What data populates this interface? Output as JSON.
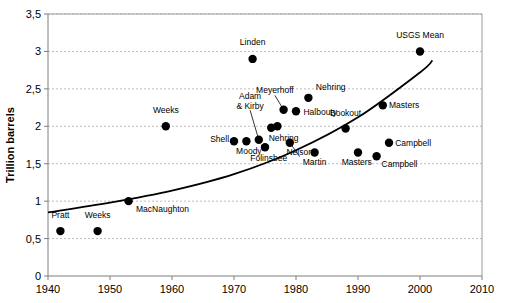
{
  "chart_data": {
    "type": "scatter",
    "title": "",
    "xlabel": "",
    "ylabel": "Trillion barrels",
    "xlim": [
      1940,
      2010
    ],
    "ylim": [
      0,
      3.5
    ],
    "xticks": [
      "1940",
      "1950",
      "1960",
      "1970",
      "1980",
      "1990",
      "2000",
      "2010"
    ],
    "xtick_values": [
      1940,
      1950,
      1960,
      1970,
      1980,
      1990,
      2000,
      2010
    ],
    "yticks": [
      "0",
      "0,5",
      "1",
      "1,5",
      "2",
      "2,5",
      "3",
      "3,5"
    ],
    "ytick_values": [
      0,
      0.5,
      1,
      1.5,
      2,
      2.5,
      3,
      3.5
    ],
    "grid": "horizontal",
    "legend": "none",
    "decimal_separator": ",",
    "points": [
      {
        "label": "Pratt",
        "x": 1942,
        "y": 0.6,
        "lx": 1942,
        "ly": 0.78,
        "anchor": "middle",
        "leader": false
      },
      {
        "label": "Weeks",
        "x": 1948,
        "y": 0.6,
        "lx": 1948,
        "ly": 0.78,
        "anchor": "middle",
        "leader": false
      },
      {
        "label": "MacNaughton",
        "x": 1953,
        "y": 1.0,
        "lx": 1954.2,
        "ly": 0.86,
        "anchor": "start",
        "leader": false
      },
      {
        "label": "Weeks",
        "x": 1959,
        "y": 2.0,
        "lx": 1959,
        "ly": 2.18,
        "anchor": "middle",
        "leader": false
      },
      {
        "label": "Shell",
        "x": 1970,
        "y": 1.8,
        "lx": 1969.2,
        "ly": 1.79,
        "anchor": "end",
        "leader": false
      },
      {
        "label": "Moody",
        "x": 1972,
        "y": 1.8,
        "lx": 1972.4,
        "ly": 1.63,
        "anchor": "middle",
        "leader": false
      },
      {
        "label": "Adam & Kirby",
        "x": 1974,
        "y": 1.82,
        "lx": 1972.6,
        "ly": 2.24,
        "anchor": "middle",
        "leader": true
      },
      {
        "label": "Linden",
        "x": 1973,
        "y": 2.9,
        "lx": 1973,
        "ly": 3.08,
        "anchor": "middle",
        "leader": false
      },
      {
        "label": "Folinsbee",
        "x": 1975,
        "y": 1.72,
        "lx": 1975.6,
        "ly": 1.53,
        "anchor": "middle",
        "leader": false
      },
      {
        "label": "Nehring",
        "x": 1976,
        "y": 1.98,
        "lx": 1978.0,
        "ly": 1.8,
        "anchor": "middle",
        "leader": false
      },
      {
        "label": "Adam2",
        "x": 1977,
        "y": 2.0,
        "lx": 1977,
        "ly": 2.0,
        "anchor": "middle",
        "leader": false,
        "hide_label": true
      },
      {
        "label": "Meyerhoff",
        "x": 1978,
        "y": 2.22,
        "lx": 1976.6,
        "ly": 2.44,
        "anchor": "middle",
        "leader": true
      },
      {
        "label": "Nelson",
        "x": 1979,
        "y": 1.78,
        "lx": 1980.6,
        "ly": 1.62,
        "anchor": "middle",
        "leader": true
      },
      {
        "label": "Halbouty",
        "x": 1980,
        "y": 2.2,
        "lx": 1981.2,
        "ly": 2.15,
        "anchor": "start",
        "leader": false
      },
      {
        "label": "Nehring",
        "x": 1982,
        "y": 2.38,
        "lx": 1983.2,
        "ly": 2.48,
        "anchor": "start",
        "leader": false
      },
      {
        "label": "Martin",
        "x": 1983,
        "y": 1.65,
        "lx": 1983,
        "ly": 1.48,
        "anchor": "middle",
        "leader": false
      },
      {
        "label": "Bookout",
        "x": 1988,
        "y": 1.97,
        "lx": 1988,
        "ly": 2.14,
        "anchor": "middle",
        "leader": false
      },
      {
        "label": "Masters",
        "x": 1990,
        "y": 1.65,
        "lx": 1989.8,
        "ly": 1.48,
        "anchor": "middle",
        "leader": false
      },
      {
        "label": "Campbell",
        "x": 1993,
        "y": 1.6,
        "lx": 1993.8,
        "ly": 1.46,
        "anchor": "start",
        "leader": false
      },
      {
        "label": "Masters",
        "x": 1994,
        "y": 2.28,
        "lx": 1995.0,
        "ly": 2.24,
        "anchor": "start",
        "leader": false
      },
      {
        "label": "Campbell",
        "x": 1995,
        "y": 1.78,
        "lx": 1996.0,
        "ly": 1.74,
        "anchor": "start",
        "leader": false
      },
      {
        "label": "USGS Mean",
        "x": 2000,
        "y": 3.0,
        "lx": 2000,
        "ly": 3.18,
        "anchor": "middle",
        "leader": false
      }
    ],
    "trend_curve": {
      "description": "rising trend line",
      "points": [
        {
          "x": 1940,
          "y": 0.85
        },
        {
          "x": 1950,
          "y": 0.98
        },
        {
          "x": 1960,
          "y": 1.14
        },
        {
          "x": 1970,
          "y": 1.36
        },
        {
          "x": 1980,
          "y": 1.68
        },
        {
          "x": 1990,
          "y": 2.12
        },
        {
          "x": 2000,
          "y": 2.72
        },
        {
          "x": 2002,
          "y": 2.88
        }
      ]
    }
  }
}
